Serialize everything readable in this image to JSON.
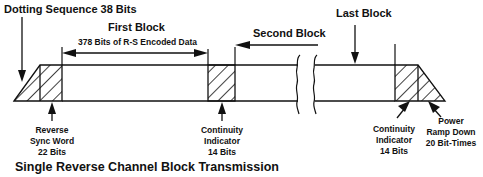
{
  "diagram": {
    "title": "Single Reverse Channel Block Transmission",
    "labels": {
      "dotting": "Dotting Sequence 38 Bits",
      "first_block": "First Block",
      "first_block_sub": "378 Bits of R-S Encoded Data",
      "second_block": "Second Block",
      "last_block": "Last Block",
      "sync_word_1": "Reverse",
      "sync_word_2": "Sync Word",
      "sync_word_3": "22 Bits",
      "ci1_1": "Continuity",
      "ci1_2": "Indicator",
      "ci1_3": "14 Bits",
      "ci2_1": "Continuity",
      "ci2_2": "Indicator",
      "ci2_3": "14 Bits",
      "ramp_1": "Power",
      "ramp_2": "Ramp Down",
      "ramp_3": "20 Bit-Times"
    },
    "segments": [
      {
        "name": "Dotting Sequence",
        "bits": 38
      },
      {
        "name": "Reverse Sync Word",
        "bits": 22
      },
      {
        "name": "First Block",
        "bits": 378
      },
      {
        "name": "Continuity Indicator",
        "bits": 14
      },
      {
        "name": "Second Block",
        "bits": null
      },
      {
        "name": "Last Block",
        "bits": null
      },
      {
        "name": "Continuity Indicator",
        "bits": 14
      },
      {
        "name": "Power Ramp Down",
        "bit_times": 20
      }
    ]
  }
}
